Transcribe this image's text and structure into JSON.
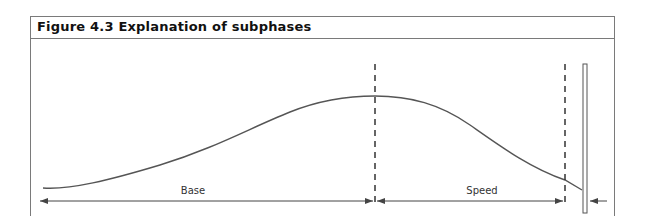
{
  "figure": {
    "title": "Figure 4.3 Explanation of subphases"
  },
  "diagram": {
    "type": "phase-diagram",
    "curve_description": "Smooth performance curve rising from left, peaking at the boundary between Base and Speed, then declining toward the right end",
    "phases": [
      {
        "label": "Base",
        "start_x": 43,
        "end_x": 375
      },
      {
        "label": "Speed",
        "start_x": 375,
        "end_x": 565
      }
    ],
    "dividers": [
      {
        "kind": "dashed-line",
        "x": 375
      },
      {
        "kind": "dashed-line",
        "x": 565
      },
      {
        "kind": "double-bar",
        "x": 585
      }
    ],
    "colors": {
      "line": "#555555",
      "frame": "#7a7a7a",
      "text": "#333333"
    }
  }
}
